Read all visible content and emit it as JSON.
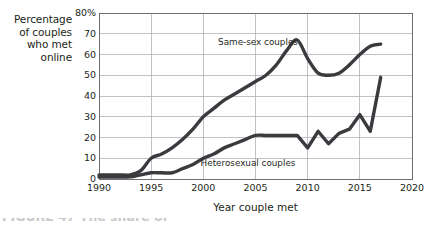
{
  "figure": {
    "y_axis_title_lines": [
      "Percentage",
      "of couples",
      "who met",
      "online"
    ],
    "x_axis_title": "Year couple met",
    "caption_fragment": "FIGURE 47 The share of"
  },
  "chart_data": {
    "type": "line",
    "title": "",
    "xlabel": "Year couple met",
    "ylabel": "Percentage of couples who met online",
    "xlim": [
      1990,
      2020
    ],
    "ylim": [
      0,
      80
    ],
    "xticks": [
      1990,
      1995,
      2000,
      2005,
      2010,
      2015,
      2020
    ],
    "xtick_labels": [
      "1990",
      "1995",
      "2000",
      "2005",
      "2010",
      "2015",
      "2020"
    ],
    "yticks": [
      0,
      10,
      20,
      30,
      40,
      50,
      60,
      70,
      80
    ],
    "ytick_labels": [
      "0",
      "10",
      "20",
      "30",
      "40",
      "50",
      "60",
      "70",
      "80%"
    ],
    "grid": true,
    "grid_axis": "both",
    "legend": "inline-annotations",
    "line_color": "#3b3b3f",
    "grid_color": "#b3b3b8",
    "axis_color": "#6e6e73",
    "background": "#ffffff",
    "series": [
      {
        "name": "Same-sex couples",
        "label_position": "inline",
        "x": [
          1990,
          1991,
          1992,
          1993,
          1994,
          1995,
          1996,
          1997,
          1998,
          1999,
          2000,
          2001,
          2002,
          2003,
          2004,
          2005,
          2006,
          2007,
          2008,
          2009,
          2010,
          2011,
          2012,
          2013,
          2014,
          2015,
          2016,
          2017
        ],
        "values": [
          2,
          2,
          2,
          2,
          4,
          10,
          12,
          15,
          19,
          24,
          30,
          34,
          38,
          41,
          44,
          47,
          50,
          55,
          62,
          67,
          58,
          51,
          50,
          51,
          55,
          60,
          64,
          65
        ]
      },
      {
        "name": "Heterosexual couples",
        "label_position": "inline",
        "x": [
          1990,
          1991,
          1992,
          1993,
          1994,
          1995,
          1996,
          1997,
          1998,
          1999,
          2000,
          2001,
          2002,
          2003,
          2004,
          2005,
          2006,
          2007,
          2008,
          2009,
          2010,
          2011,
          2012,
          2013,
          2014,
          2015,
          2016,
          2017
        ],
        "values": [
          1,
          1,
          1,
          1,
          2,
          3,
          3,
          3,
          5,
          7,
          10,
          12,
          15,
          17,
          19,
          21,
          21,
          21,
          21,
          21,
          15,
          23,
          17,
          22,
          24,
          31,
          23,
          49
        ]
      }
    ],
    "annotations": [
      {
        "text": "Same-sex couples",
        "series": "Same-sex couples"
      },
      {
        "text": "Heterosexual couples",
        "series": "Heterosexual couples"
      }
    ]
  }
}
